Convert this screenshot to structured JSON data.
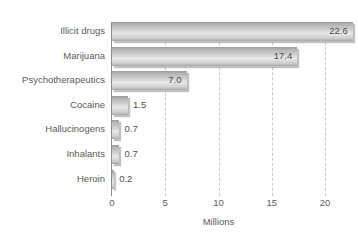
{
  "caption_remnant": "",
  "chart_data": {
    "type": "bar",
    "orientation": "horizontal",
    "title": "",
    "xlabel": "Millions",
    "ylabel": "",
    "xlim": [
      0,
      20
    ],
    "xticks": [
      "0",
      "5",
      "10",
      "15",
      "20"
    ],
    "xtick_values": [
      0,
      5,
      10,
      15,
      20
    ],
    "grid": "vertical-dashed",
    "legend": "none",
    "categories": [
      "Illicit drugs",
      "Marijuana",
      "Psychotherapeutics",
      "Cocaine",
      "Hallucinogens",
      "Inhalants",
      "Heroin"
    ],
    "values": [
      22.6,
      17.4,
      7.0,
      1.5,
      0.7,
      0.7,
      0.2
    ],
    "value_labels": [
      "22.6",
      "17.4",
      "7.0",
      "1.5",
      "0.7",
      "0.7",
      "0.2"
    ],
    "label_placement": [
      "inside",
      "inside",
      "inside",
      "outside",
      "outside",
      "outside",
      "outside"
    ],
    "bar_color": "#d8d8d8",
    "bar_edge_color": "#9d9d9d",
    "axis_color": "#8c8c8c",
    "grid_color": "#c9c9c9",
    "text_color": "#5a5a5a",
    "background": "#ffffff"
  }
}
